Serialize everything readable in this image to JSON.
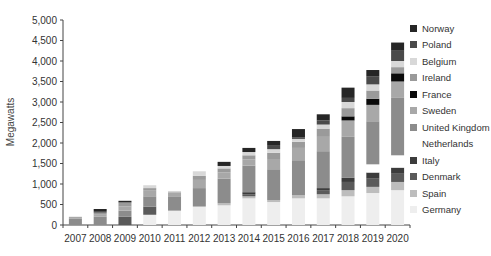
{
  "chart_data": {
    "type": "bar",
    "stacked": true,
    "title": "",
    "xlabel": "",
    "ylabel": "Megawatts",
    "ylim": [
      0,
      5000
    ],
    "yticks": [
      0,
      500,
      1000,
      1500,
      2000,
      2500,
      3000,
      3500,
      4000,
      4500,
      5000
    ],
    "ytick_labels": [
      "0",
      "500",
      "1,000",
      "1,500",
      "2,000",
      "2,500",
      "3,000",
      "3,500",
      "4,000",
      "4,500",
      "5,000"
    ],
    "grid": false,
    "legend_position": "right",
    "categories": [
      "2007",
      "2008",
      "2009",
      "2010",
      "2011",
      "2012",
      "2013",
      "2014",
      "2015",
      "2016",
      "2017",
      "2018",
      "2019",
      "2020"
    ],
    "series": [
      {
        "name": "Germany",
        "color": "#eeeeee",
        "values": [
          0,
          0,
          0,
          250,
          350,
          450,
          480,
          650,
          560,
          650,
          650,
          700,
          780,
          850
        ]
      },
      {
        "name": "Spain",
        "color": "#bdbdbd",
        "values": [
          0,
          0,
          0,
          0,
          0,
          0,
          50,
          50,
          50,
          80,
          100,
          150,
          150,
          200
        ]
      },
      {
        "name": "Denmark",
        "color": "#5a5a5a",
        "values": [
          0,
          0,
          200,
          200,
          0,
          0,
          0,
          50,
          0,
          0,
          100,
          200,
          200,
          200
        ]
      },
      {
        "name": "Italy",
        "color": "#3c3c3c",
        "values": [
          0,
          0,
          0,
          0,
          0,
          0,
          0,
          50,
          0,
          0,
          50,
          100,
          150,
          150
        ]
      },
      {
        "name": "Netherlands",
        "color": "#ffffff",
        "values": [
          0,
          0,
          0,
          0,
          0,
          0,
          0,
          0,
          0,
          0,
          0,
          0,
          200,
          300
        ]
      },
      {
        "name": "United Kingdom",
        "color": "#8c8c8c",
        "values": [
          150,
          200,
          150,
          250,
          350,
          450,
          600,
          650,
          750,
          850,
          900,
          1000,
          1050,
          1400
        ]
      },
      {
        "name": "Sweden",
        "color": "#a8a8a8",
        "values": [
          50,
          50,
          100,
          150,
          100,
          200,
          150,
          150,
          250,
          300,
          350,
          400,
          400,
          400
        ]
      },
      {
        "name": "France",
        "color": "#0a0a0a",
        "values": [
          0,
          0,
          0,
          0,
          0,
          0,
          0,
          0,
          0,
          0,
          0,
          100,
          150,
          200
        ]
      },
      {
        "name": "Ireland",
        "color": "#9a9a9a",
        "values": [
          0,
          50,
          100,
          50,
          0,
          100,
          100,
          100,
          150,
          150,
          200,
          200,
          200,
          150
        ]
      },
      {
        "name": "Belgium",
        "color": "#d8d8d8",
        "values": [
          0,
          0,
          0,
          70,
          30,
          110,
          60,
          80,
          90,
          70,
          100,
          150,
          150,
          150
        ]
      },
      {
        "name": "Poland",
        "color": "#4a4a4a",
        "values": [
          0,
          40,
          0,
          0,
          0,
          0,
          0,
          0,
          100,
          40,
          100,
          100,
          200,
          250
        ]
      },
      {
        "name": "Norway",
        "color": "#262626",
        "values": [
          0,
          50,
          40,
          0,
          0,
          0,
          100,
          100,
          100,
          200,
          150,
          250,
          150,
          200
        ]
      }
    ],
    "legend_order": [
      "Norway",
      "Poland",
      "Belgium",
      "Ireland",
      "France",
      "Sweden",
      "United Kingdom",
      "Netherlands",
      "Italy",
      "Denmark",
      "Spain",
      "Germany"
    ]
  }
}
